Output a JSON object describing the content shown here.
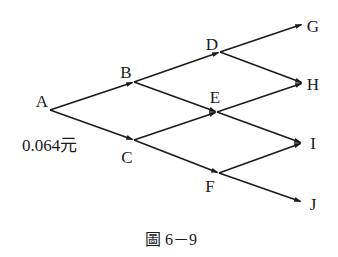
{
  "diagram": {
    "type": "binomial-tree",
    "line_color": "#1a1a1a",
    "nodes": [
      {
        "id": "A",
        "label": "A",
        "point": [
          50,
          110
        ],
        "label_pos": [
          42,
          101
        ]
      },
      {
        "id": "B",
        "label": "B",
        "point": [
          134,
          82
        ],
        "label_pos": [
          126,
          72
        ]
      },
      {
        "id": "C",
        "label": "C",
        "point": [
          134,
          140
        ],
        "label_pos": [
          127,
          157
        ]
      },
      {
        "id": "D",
        "label": "D",
        "point": [
          220,
          52
        ],
        "label_pos": [
          212,
          44
        ]
      },
      {
        "id": "E",
        "label": "E",
        "point": [
          217,
          112
        ],
        "label_pos": [
          215,
          97
        ]
      },
      {
        "id": "F",
        "label": "F",
        "point": [
          219,
          173
        ],
        "label_pos": [
          210,
          186
        ]
      },
      {
        "id": "G",
        "label": "G",
        "point": [
          303,
          24
        ],
        "label_pos": [
          313,
          26
        ]
      },
      {
        "id": "H",
        "label": "H",
        "point": [
          303,
          83
        ],
        "label_pos": [
          313,
          84
        ]
      },
      {
        "id": "I",
        "label": "I",
        "point": [
          302,
          143
        ],
        "label_pos": [
          313,
          143
        ]
      },
      {
        "id": "J",
        "label": "J",
        "point": [
          302,
          202
        ],
        "label_pos": [
          313,
          204
        ]
      }
    ],
    "edges": [
      {
        "from": "A",
        "to": "B"
      },
      {
        "from": "A",
        "to": "C"
      },
      {
        "from": "B",
        "to": "D"
      },
      {
        "from": "B",
        "to": "E"
      },
      {
        "from": "C",
        "to": "E"
      },
      {
        "from": "C",
        "to": "F"
      },
      {
        "from": "D",
        "to": "G"
      },
      {
        "from": "D",
        "to": "H"
      },
      {
        "from": "E",
        "to": "H"
      },
      {
        "from": "E",
        "to": "I"
      },
      {
        "from": "F",
        "to": "I"
      },
      {
        "from": "F",
        "to": "J"
      }
    ],
    "value_label": {
      "text": "0.064元",
      "pos": [
        22,
        145
      ]
    },
    "caption": {
      "text": "圖 6－9",
      "pos": [
        171,
        240
      ]
    }
  }
}
